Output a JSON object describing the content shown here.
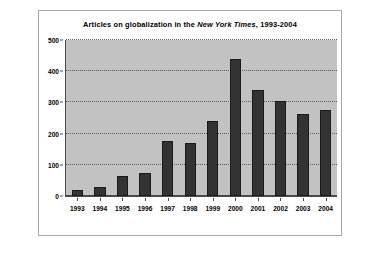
{
  "chart_data": {
    "type": "bar",
    "title": "Articles on globalization in the New York Times, 1993-2004",
    "title_parts": {
      "before_italic": "Articles on globalization in the ",
      "italic": "New York Times",
      "after_italic": ", 1993-2004"
    },
    "categories": [
      "1993",
      "1994",
      "1995",
      "1996",
      "1997",
      "1998",
      "1999",
      "2000",
      "2001",
      "2002",
      "2003",
      "2004"
    ],
    "values": [
      18,
      28,
      65,
      75,
      176,
      169,
      240,
      440,
      340,
      305,
      262,
      275
    ],
    "xlabel": "",
    "ylabel": "",
    "ylim": [
      0,
      500
    ],
    "y_ticks": [
      0,
      100,
      200,
      300,
      400,
      500
    ],
    "y_tick_labels": [
      "0",
      "100",
      "200",
      "300",
      "400",
      "500"
    ],
    "grid": true,
    "legend": false,
    "colors": {
      "bar": "#333333",
      "plot_background": "#c2c2c2",
      "figure_background": "#ffffff",
      "axis": "#4a4a4a",
      "gridline": "#5a5a5a",
      "text": "#000000"
    }
  }
}
